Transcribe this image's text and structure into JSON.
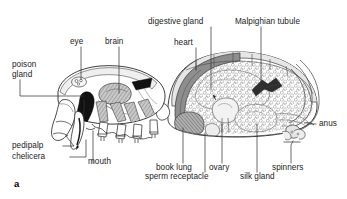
{
  "figure": {
    "panel_letter": "a",
    "background_color": "#ffffff",
    "ink_color": "#1b1b1b",
    "leader_color": "#3a3a3a"
  },
  "labels": {
    "poison_gland": "poison\ngland",
    "eye": "eye",
    "brain": "brain",
    "digestive_gland": "digestive gland",
    "heart": "heart",
    "malpighian_tubule": "Malpighian tubule",
    "anus": "anus",
    "spinners": "spinners",
    "silk_gland": "silk gland",
    "ovary": "ovary",
    "sperm_receptacle": "sperm receptacle",
    "book_lung": "book lung",
    "mouth": "mouth",
    "chelicera": "chelicera",
    "pedipalp": "pedipalp"
  },
  "anatomy_parts": [
    "poison gland",
    "eye",
    "brain",
    "digestive gland",
    "heart",
    "Malpighian tubule",
    "anus",
    "spinners",
    "silk gland",
    "ovary",
    "sperm receptacle",
    "book lung",
    "mouth",
    "chelicera",
    "pedipalp"
  ],
  "palette": {
    "outline": "#262626",
    "mid_gray": "#8e8e8e",
    "dark_gray": "#545454",
    "pale_gray": "#d9d9d9",
    "tissue_gray": "#b5b5b5",
    "black_gland": "#111111"
  }
}
